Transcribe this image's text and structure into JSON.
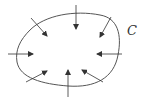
{
  "diagram": {
    "curve_label": "C",
    "curve_color": "#555555",
    "arrow_color": "#333333",
    "arrows": [
      {
        "id": "top-left",
        "x1": 31,
        "y1": 18,
        "x2": 47,
        "y2": 36
      },
      {
        "id": "top",
        "x1": 76,
        "y1": 5,
        "x2": 76,
        "y2": 29
      },
      {
        "id": "top-right",
        "x1": 111,
        "y1": 17,
        "x2": 100,
        "y2": 37
      },
      {
        "id": "left",
        "x1": 8,
        "y1": 54,
        "x2": 33,
        "y2": 54
      },
      {
        "id": "right",
        "x1": 122,
        "y1": 54,
        "x2": 97,
        "y2": 54
      },
      {
        "id": "bottom-left",
        "x1": 26,
        "y1": 82,
        "x2": 47,
        "y2": 71
      },
      {
        "id": "bottom",
        "x1": 68,
        "y1": 97,
        "x2": 68,
        "y2": 70
      },
      {
        "id": "bottom-right",
        "x1": 103,
        "y1": 82,
        "x2": 82,
        "y2": 70
      }
    ]
  }
}
